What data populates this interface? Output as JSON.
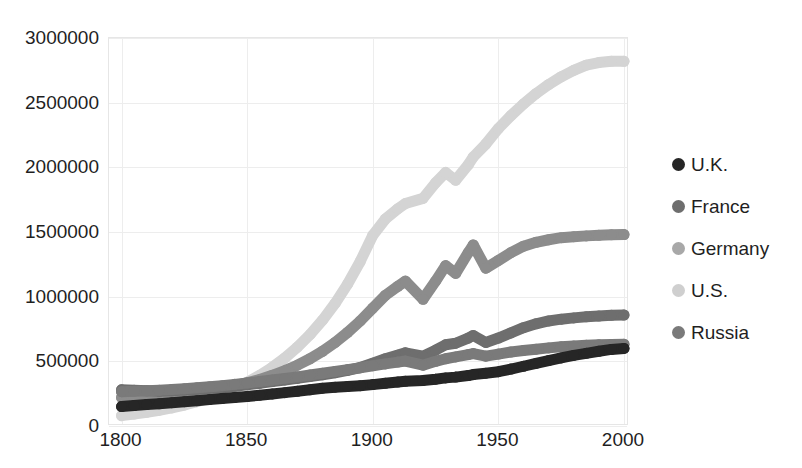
{
  "chart_data": {
    "type": "line",
    "title": "",
    "xlabel": "",
    "ylabel": "",
    "xlim": [
      1795,
      2002
    ],
    "ylim": [
      0,
      3000000
    ],
    "grid": true,
    "legend_position": "right",
    "marker_style": "circle",
    "x_ticks": [
      "1800",
      "1850",
      "1900",
      "1950",
      "2000"
    ],
    "x_tick_values": [
      1800,
      1850,
      1900,
      1950,
      2000
    ],
    "y_ticks": [
      "0",
      "500000",
      "1000000",
      "1500000",
      "2000000",
      "2500000",
      "3000000"
    ],
    "y_tick_values": [
      0,
      500000,
      1000000,
      1500000,
      2000000,
      2500000,
      3000000
    ],
    "x": [
      1800,
      1805,
      1810,
      1815,
      1820,
      1825,
      1830,
      1835,
      1840,
      1845,
      1850,
      1855,
      1860,
      1865,
      1870,
      1875,
      1880,
      1885,
      1890,
      1895,
      1900,
      1905,
      1910,
      1913,
      1920,
      1925,
      1929,
      1933,
      1938,
      1940,
      1945,
      1950,
      1955,
      1960,
      1965,
      1970,
      1975,
      1980,
      1985,
      1990,
      1995,
      2000
    ],
    "series": [
      {
        "name": "U.K.",
        "color": "#262626",
        "values": [
          150000,
          158000,
          166000,
          172000,
          180000,
          188000,
          196000,
          204000,
          212000,
          220000,
          228000,
          238000,
          248000,
          258000,
          268000,
          280000,
          292000,
          300000,
          306000,
          312000,
          320000,
          330000,
          340000,
          346000,
          352000,
          362000,
          372000,
          378000,
          390000,
          398000,
          408000,
          420000,
          440000,
          462000,
          484000,
          506000,
          526000,
          546000,
          562000,
          578000,
          592000,
          600000
        ]
      },
      {
        "name": "France",
        "color": "#6e6e6e",
        "values": [
          280000,
          276000,
          272000,
          268000,
          272000,
          278000,
          284000,
          292000,
          300000,
          308000,
          318000,
          330000,
          344000,
          356000,
          368000,
          382000,
          396000,
          412000,
          430000,
          452000,
          486000,
          520000,
          548000,
          566000,
          540000,
          586000,
          628000,
          640000,
          680000,
          700000,
          646000,
          680000,
          720000,
          760000,
          790000,
          812000,
          826000,
          836000,
          844000,
          850000,
          856000,
          858000
        ]
      },
      {
        "name": "Germany",
        "color": "#8c8c8c",
        "values": [
          220000,
          224000,
          228000,
          234000,
          242000,
          252000,
          264000,
          278000,
          294000,
          312000,
          334000,
          360000,
          392000,
          428000,
          470000,
          520000,
          578000,
          646000,
          724000,
          812000,
          912000,
          1010000,
          1080000,
          1120000,
          980000,
          1120000,
          1240000,
          1180000,
          1340000,
          1400000,
          1220000,
          1280000,
          1340000,
          1390000,
          1420000,
          1440000,
          1456000,
          1464000,
          1470000,
          1474000,
          1478000,
          1480000
        ]
      },
      {
        "name": "U.S.",
        "color": "#d4d4d4",
        "values": [
          80000,
          92000,
          106000,
          122000,
          140000,
          162000,
          188000,
          218000,
          252000,
          292000,
          338000,
          392000,
          454000,
          526000,
          610000,
          706000,
          818000,
          948000,
          1098000,
          1272000,
          1474000,
          1600000,
          1680000,
          1720000,
          1760000,
          1880000,
          1960000,
          1900000,
          2020000,
          2080000,
          2180000,
          2300000,
          2400000,
          2490000,
          2570000,
          2640000,
          2700000,
          2750000,
          2790000,
          2810000,
          2820000,
          2820000
        ]
      },
      {
        "name": "Russia",
        "color": "#7a7a7a",
        "values": [
          265000,
          268000,
          272000,
          276000,
          282000,
          288000,
          296000,
          304000,
          312000,
          322000,
          332000,
          344000,
          356000,
          368000,
          380000,
          394000,
          408000,
          422000,
          436000,
          450000,
          466000,
          480000,
          494000,
          502000,
          470000,
          500000,
          520000,
          534000,
          552000,
          560000,
          540000,
          556000,
          572000,
          584000,
          594000,
          604000,
          612000,
          618000,
          624000,
          628000,
          630000,
          632000
        ]
      }
    ]
  },
  "legend": {
    "items": [
      {
        "label": "U.K.",
        "color": "#262626"
      },
      {
        "label": "France",
        "color": "#6e6e6e"
      },
      {
        "label": "Germany",
        "color": "#a8a8a8"
      },
      {
        "label": "U.S.",
        "color": "#cfcfcf"
      },
      {
        "label": "Russia",
        "color": "#7a7a7a"
      }
    ]
  },
  "axes": {
    "y_labels": [
      "3000000",
      "2500000",
      "2000000",
      "1500000",
      "1000000",
      "500000",
      "0"
    ],
    "x_labels": [
      "1800",
      "1850",
      "1900",
      "1950",
      "2000"
    ]
  },
  "colors": {
    "background": "#ffffff",
    "gridline": "#ededed",
    "frame": "#e6e6e6",
    "text": "#1f1f1f"
  }
}
